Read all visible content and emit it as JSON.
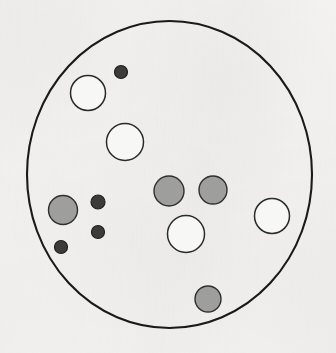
{
  "figure": {
    "title": "",
    "caption": "",
    "background_color": "#f3f2f0",
    "outline_color": "#1a1a1a"
  },
  "chart_data": {
    "type": "scatter",
    "title": "",
    "subtitle": "",
    "xlabel": "",
    "ylabel": "",
    "xlim": [
      0,
      336
    ],
    "ylim": [
      0,
      353
    ],
    "grid": false,
    "legend": null,
    "annotations": [],
    "tick_labels": {
      "x": [],
      "y": []
    },
    "boundary": {
      "name": "outer-circle",
      "shape": "circle",
      "cx": 169.5,
      "cy": 174.5,
      "rx": 142.5,
      "ry": 153.5,
      "fill": "none",
      "stroke": "#1a1a1a",
      "stroke_width": 2.1
    },
    "series": [
      {
        "name": "open-circles",
        "fill": "#f7f7f5",
        "stroke": "#2a2a2a",
        "stroke_width": 1.5,
        "points": [
          {
            "id": "open-1",
            "cx": 88,
            "cy": 93,
            "r": 17.5
          },
          {
            "id": "open-2",
            "cx": 125,
            "cy": 142,
            "r": 18.5
          },
          {
            "id": "open-3",
            "cx": 186,
            "cy": 234,
            "r": 18.5
          },
          {
            "id": "open-4",
            "cx": 272,
            "cy": 216,
            "r": 17.5
          }
        ]
      },
      {
        "name": "gray-circles",
        "fill": "#9e9e9c",
        "stroke": "#2f2f2f",
        "stroke_width": 1.4,
        "points": [
          {
            "id": "gray-1",
            "cx": 169,
            "cy": 191,
            "r": 15
          },
          {
            "id": "gray-2",
            "cx": 213,
            "cy": 190,
            "r": 14
          },
          {
            "id": "gray-3",
            "cx": 63,
            "cy": 210,
            "r": 14.5
          },
          {
            "id": "gray-4",
            "cx": 208,
            "cy": 299,
            "r": 13
          }
        ]
      },
      {
        "name": "dark-dots",
        "fill": "#3b3b3b",
        "stroke": "#202020",
        "stroke_width": 1.2,
        "points": [
          {
            "id": "dark-1",
            "cx": 121,
            "cy": 72,
            "r": 6.5
          },
          {
            "id": "dark-2",
            "cx": 98,
            "cy": 202,
            "r": 7
          },
          {
            "id": "dark-3",
            "cx": 98,
            "cy": 232,
            "r": 6.5
          },
          {
            "id": "dark-4",
            "cx": 61,
            "cy": 247,
            "r": 6.5
          }
        ]
      }
    ]
  }
}
